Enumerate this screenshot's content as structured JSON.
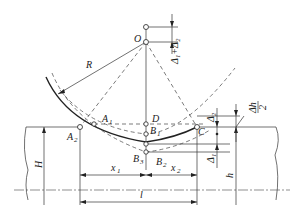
{
  "diagram": {
    "type": "geometric construction",
    "labels": {
      "O": "O",
      "R": "R",
      "A1": "A",
      "A1_sub": "1",
      "A2": "A",
      "A2_sub": "2",
      "D": "D",
      "B1": "B",
      "B1_sub": "1",
      "B2": "B",
      "B2_sub": "2",
      "B3": "B",
      "B3_sub": "3",
      "C": "C",
      "H": "H",
      "h": "h",
      "x1": "x",
      "x1_sub": "1",
      "x2": "x",
      "x2_sub": "2",
      "l": "l",
      "delta_sum": "Δ₁+Δ₂",
      "delta1": "Δ₁",
      "delta2": "Δ₂",
      "dh_half_num": "Δh",
      "dh_half_den": "2"
    },
    "colors": {
      "line": "#333333",
      "background": "#ffffff"
    }
  }
}
